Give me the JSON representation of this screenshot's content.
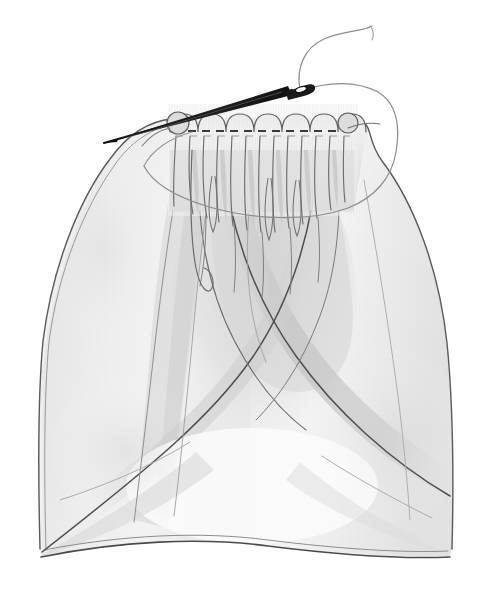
{
  "illustration": {
    "title": "Gathering fabric with a running stitch",
    "medium": "pencil-drawing",
    "caption": "",
    "background_color": "#ffffff",
    "canvas": {
      "width": 491,
      "height": 602
    }
  },
  "palette": {
    "paper": "#ffffff",
    "fabric_light": "#f2f2f2",
    "fabric_mid": "#e2e2e2",
    "fabric_shadow": "#cfcfcf",
    "fabric_deep_shadow": "#bdbdbd",
    "outline": "#4a4a4a",
    "outline_soft": "#7d7d7d",
    "pleat_line": "#6b6b6b",
    "stitch": "#3d3d3d",
    "needle_body": "#1c1c1c",
    "needle_highlight": "#8c8c8c",
    "thread": "#8a8a8a"
  },
  "objects": {
    "fabric": {
      "name": "gathered-fabric-panel",
      "top_edge_y": 118,
      "bottom_edge_y": 556,
      "left_corner_x": 40,
      "right_corner_x": 452,
      "texture": "fine vertical weave hatching"
    },
    "gathers": {
      "name": "gathered-ruffle-band",
      "count": 13,
      "start_x": 172,
      "end_x": 354,
      "crest_y": 112,
      "band_bottom_y": 210
    },
    "stitch_line": {
      "name": "running-stitch-row",
      "y": 131,
      "start_x": 174,
      "end_x": 352,
      "dash_count": 13,
      "style": "dashed"
    },
    "needle": {
      "name": "sewing-needle",
      "tip": {
        "x": 104,
        "y": 143
      },
      "eye": {
        "x": 299,
        "y": 88
      },
      "angle_deg": -16
    },
    "thread": {
      "name": "sewing-thread",
      "free_end": {
        "x": 372,
        "y": 28
      },
      "loop_right_extent_x": 398,
      "loop_bottom_y": 212
    }
  },
  "annotations": []
}
